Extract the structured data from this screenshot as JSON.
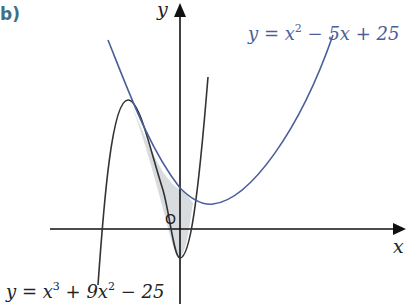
{
  "part_label": "b)",
  "axes": {
    "x_label": "x",
    "y_label": "y",
    "origin_label": "O"
  },
  "curves": {
    "parabola": {
      "eq_prefix": "y = x",
      "eq_exp": "2",
      "eq_suffix": " − 5x + 25",
      "color": "#4a5e9a"
    },
    "cubic": {
      "eq_prefix": "y = x",
      "eq_exp1": "3",
      "eq_mid": " + 9x",
      "eq_exp2": "2",
      "eq_suffix": " − 25",
      "color": "#333333"
    }
  },
  "shaded_region": {
    "fill": "#d9dcdf",
    "description": "area enclosed between the parabola and the cubic"
  }
}
